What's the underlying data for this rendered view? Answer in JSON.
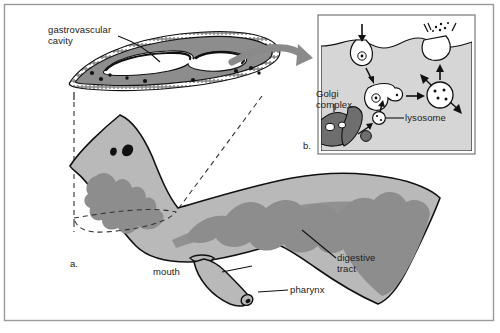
{
  "figure": {
    "title_present": false,
    "frame_color": "#9a9a9a",
    "background": "#ffffff"
  },
  "palette": {
    "body_fill": "#b9b9b9",
    "tract_fill": "#8d8d8d",
    "cavity_fill": "#ffffff",
    "section_fill": "#8d8d8d",
    "inset_fill": "#d6d6d6",
    "golgi_fill": "#6e6e6e",
    "outline": "#111111",
    "arrow_fill": "#8a8a8a",
    "dashed": "#333333"
  },
  "labels": {
    "gastrovascular_cavity": "gastrovascular\ncavity",
    "gastrovascular_cavity_line1": "gastrovascular",
    "gastrovascular_cavity_line2": "cavity",
    "golgi_complex_line1": "Golgi",
    "golgi_complex_line2": "complex",
    "lysosome": "lysosome",
    "digestive_tract_line1": "digestive",
    "digestive_tract_line2": "tract",
    "mouth": "mouth",
    "pharynx": "pharynx",
    "panel_a": "a.",
    "panel_b": "b."
  },
  "panels": [
    {
      "id": "a",
      "marker": "a.",
      "description": "Whole planarian body with branched digestive tract, mouth and pharynx",
      "parts": [
        "digestive tract",
        "mouth",
        "pharynx",
        "eyespots"
      ]
    },
    {
      "id": "b",
      "marker": "b.",
      "description": "Cellular detail of intracellular digestion at the gastrodermis",
      "parts": [
        "Golgi complex",
        "lysosome",
        "food vacuole",
        "phagocytosis",
        "exocytosis"
      ]
    }
  ],
  "cross_section": {
    "name": "transverse section through the gastrovascular cavity",
    "features": [
      "ciliated epithelium",
      "gastrovascular cavity lumen",
      "parenchyma nuclei"
    ]
  },
  "inset_steps": [
    "food particle enters by endocytosis",
    "vesicle fuses with lysosome from Golgi complex",
    "digestion within food vacuole",
    "residue expelled by exocytosis"
  ]
}
